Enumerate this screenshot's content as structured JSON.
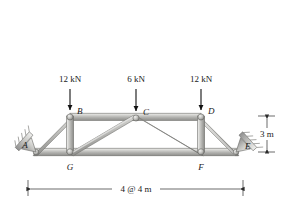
{
  "figure": {
    "type": "truss-diagram"
  },
  "loads": [
    {
      "id": "load-b",
      "magnitude": "12 kN",
      "at_node": "B",
      "direction": "down"
    },
    {
      "id": "load-c",
      "magnitude": "6 kN",
      "at_node": "C",
      "direction": "down"
    },
    {
      "id": "load-d",
      "magnitude": "12 kN",
      "at_node": "D",
      "direction": "down"
    }
  ],
  "nodes": [
    {
      "id": "A",
      "label": "A",
      "x": 34,
      "y": 152,
      "label_dx": -9,
      "label_dy": -4
    },
    {
      "id": "B",
      "label": "B",
      "x": 70,
      "y": 116,
      "label_dx": 5,
      "label_dy": -2
    },
    {
      "id": "C",
      "label": "C",
      "x": 136,
      "y": 117,
      "label_dx": 5,
      "label_dy": -2
    },
    {
      "id": "D",
      "label": "D",
      "x": 201,
      "y": 116,
      "label_dx": 5,
      "label_dy": -2
    },
    {
      "id": "E",
      "label": "E",
      "x": 238,
      "y": 152,
      "label_dx": 5,
      "label_dy": -3
    },
    {
      "id": "F",
      "label": "F",
      "x": 201,
      "y": 152,
      "label_dx": -2,
      "label_dy": 14
    },
    {
      "id": "G",
      "label": "G",
      "x": 70,
      "y": 152,
      "label_dx": -2,
      "label_dy": 14
    }
  ],
  "members": [
    {
      "from": "A",
      "to": "B",
      "kind": "chord"
    },
    {
      "from": "B",
      "to": "C",
      "kind": "chord"
    },
    {
      "from": "C",
      "to": "D",
      "kind": "chord"
    },
    {
      "from": "D",
      "to": "E",
      "kind": "chord"
    },
    {
      "from": "A",
      "to": "G",
      "kind": "chord"
    },
    {
      "from": "G",
      "to": "F",
      "kind": "chord"
    },
    {
      "from": "F",
      "to": "E",
      "kind": "chord"
    },
    {
      "from": "B",
      "to": "G",
      "kind": "vertical"
    },
    {
      "from": "D",
      "to": "F",
      "kind": "vertical"
    },
    {
      "from": "G",
      "to": "C",
      "kind": "diagonal"
    },
    {
      "from": "C",
      "to": "F",
      "kind": "diagonal"
    }
  ],
  "supports": [
    {
      "id": "support-a",
      "at_node": "A",
      "type": "inclined-pin"
    },
    {
      "id": "support-e",
      "at_node": "E",
      "type": "inclined-pin"
    }
  ],
  "dimensions": {
    "height": {
      "label": "3 m",
      "orientation": "vertical",
      "position": "right"
    },
    "span": {
      "label": "4 @ 4 m",
      "orientation": "horizontal",
      "position": "bottom"
    }
  },
  "colors": {
    "member_light": "#e2e2e0",
    "member_mid": "#b9b9b6",
    "member_dark": "#8f8f8c",
    "outline": "#6e6e6b",
    "text": "#1a1a1a",
    "background": "#ffffff"
  }
}
